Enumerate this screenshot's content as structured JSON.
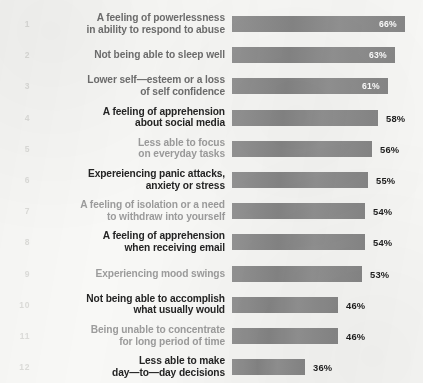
{
  "chart_data": {
    "type": "bar",
    "orientation": "horizontal",
    "title": "",
    "subtitle": "",
    "xlabel": "",
    "ylabel": "",
    "xlim": [
      0,
      70
    ],
    "grid": false,
    "legend": null,
    "value_suffix": "%",
    "categories": [
      "A feeling of powerlessness\nin ability to respond to abuse",
      "Not being able to sleep well",
      "Lower self—esteem or a loss\nof self confidence",
      "A feeling of apprehension\nabout social media",
      "Less able to focus\non everyday tasks",
      "Expereiencing panic attacks,\nanxiety or stress",
      "A feeling of isolation or a need\nto withdraw into yourself",
      "A feeling of apprehension\nwhen receiving email",
      "Experiencing mood swings",
      "Not being able to accomplish\nwhat usually would",
      "Being unable to concentrate\nfor long period of time",
      "Less able to make\nday—to—day decisions"
    ],
    "values": [
      66,
      63,
      61,
      58,
      56,
      55,
      54,
      54,
      53,
      46,
      46,
      36
    ],
    "value_labels": [
      "66%",
      "63%",
      "61%",
      "58%",
      "56%",
      "55%",
      "54%",
      "54%",
      "53%",
      "46%",
      "46%",
      "36%"
    ],
    "rank_labels": [
      "1",
      "2",
      "3",
      "4",
      "5",
      "6",
      "7",
      "8",
      "9",
      "10",
      "11",
      "12"
    ],
    "label_placement": [
      "inside",
      "inside",
      "inside",
      "outside",
      "outside",
      "outside",
      "outside",
      "outside",
      "outside",
      "outside",
      "outside",
      "outside"
    ],
    "label_emphasis": [
      "mid",
      "mid",
      "mid",
      "dark",
      "light",
      "dark",
      "light",
      "dark",
      "light",
      "dark",
      "light",
      "dark"
    ],
    "colors": {
      "background": "#f8f8f6",
      "bar": "#8c8c8c",
      "label_dark": "#242424",
      "label_mid": "#6e6e6e",
      "label_light": "#9c9c9c",
      "rank_number": "#dcdcd9",
      "value_inside": "#ffffff",
      "value_outside": "#1e1e1e"
    }
  }
}
